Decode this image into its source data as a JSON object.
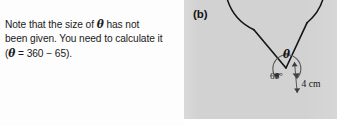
{
  "note": {
    "line1_pre": "Note that the size of ",
    "line1_theta": "θ",
    "line1_post": " has not",
    "line2": "been given. You need to calculate it",
    "line3_pre": "(",
    "line3_theta": "θ",
    "line3_post": " = 360 − 65)."
  },
  "figure": {
    "part_label": "(b)",
    "theta_label": "θ",
    "angle_label": "65°",
    "radius_label": "4 cm",
    "background_color": "#d2d2d2",
    "stroke_color": "#141414"
  },
  "geometry": {
    "type": "reflex-sector",
    "center": {
      "x": 102,
      "y": 68
    },
    "radius": 50,
    "reflex_angle_degrees": 295,
    "minor_angle_degrees": 65,
    "radius_length": "4 cm",
    "marker_arc_radius": 14,
    "arm_a_angle_degrees": 130,
    "arm_b_angle_degrees": 65
  }
}
